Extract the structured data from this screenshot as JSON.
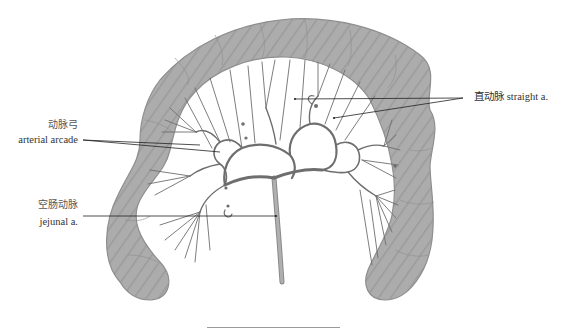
{
  "figure": {
    "labels": {
      "straight_artery": "直动脉 straight a.",
      "arterial_arcade_cn": "动脉弓",
      "arterial_arcade_en": "arterial arcade",
      "jejunal_artery_cn": "空肠动脉",
      "jejunal_artery_en": "jejunal a."
    },
    "colors": {
      "intestine_fill": "#a9a9a9",
      "intestine_shade": "#8c8c8c",
      "vessel": "#6e6e6e",
      "leader_line": "#222222",
      "label_text": "#333333",
      "background": "#ffffff"
    }
  }
}
